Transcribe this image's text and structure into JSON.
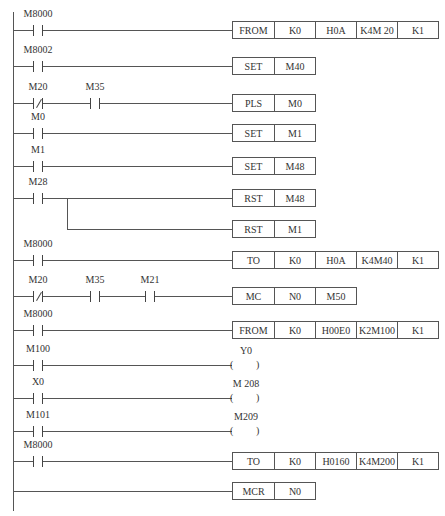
{
  "diagram": {
    "type": "PLC ladder diagram",
    "line_color": "#555555",
    "rungs": [
      {
        "contacts": [
          {
            "label": "M8000",
            "type": "NO"
          }
        ],
        "instruction": [
          "FROM",
          "K0",
          "H0A",
          "K4M 20",
          "K1"
        ]
      },
      {
        "contacts": [
          {
            "label": "M8002",
            "type": "NO"
          }
        ],
        "instruction": [
          "SET",
          "M40"
        ]
      },
      {
        "contacts": [
          {
            "label": "M20",
            "type": "NC"
          },
          {
            "label": "M35",
            "type": "NO"
          }
        ],
        "instruction": [
          "PLS",
          "M0"
        ]
      },
      {
        "contacts": [
          {
            "label": "M0",
            "type": "NO"
          }
        ],
        "instruction": [
          "SET",
          "M1"
        ]
      },
      {
        "contacts": [
          {
            "label": "M1",
            "type": "NO"
          }
        ],
        "instruction": [
          "SET",
          "M48"
        ]
      },
      {
        "contacts": [
          {
            "label": "M28",
            "type": "NO"
          }
        ],
        "instruction": [
          "RST",
          "M48"
        ],
        "branch_instruction": [
          "RST",
          "M1"
        ]
      },
      {
        "contacts": [
          {
            "label": "M8000",
            "type": "NO"
          }
        ],
        "instruction": [
          "TO",
          "K0",
          "H0A",
          "K4M40",
          "K1"
        ]
      },
      {
        "contacts": [
          {
            "label": "M20",
            "type": "NC"
          },
          {
            "label": "M35",
            "type": "NO"
          },
          {
            "label": "M21",
            "type": "NO"
          }
        ],
        "instruction": [
          "MC",
          "N0",
          "M50"
        ]
      },
      {
        "contacts": [
          {
            "label": "M8000",
            "type": "NO"
          }
        ],
        "instruction": [
          "FROM",
          "K0",
          "H00E0",
          "K2M100",
          "K1"
        ]
      },
      {
        "contacts": [
          {
            "label": "M100",
            "type": "NO"
          }
        ],
        "coil": "Y0"
      },
      {
        "contacts": [
          {
            "label": "X0",
            "type": "NO"
          }
        ],
        "coil": "M 208"
      },
      {
        "contacts": [
          {
            "label": "M101",
            "type": "NO"
          }
        ],
        "coil": "M209"
      },
      {
        "contacts": [
          {
            "label": "M8000",
            "type": "NO"
          }
        ],
        "instruction": [
          "TO",
          "K0",
          "H0160",
          "K4M200",
          "K1"
        ]
      },
      {
        "contacts": [],
        "instruction": [
          "MCR",
          "N0"
        ]
      }
    ],
    "coil_symbols": {
      "open": "(",
      "close": ")"
    }
  }
}
